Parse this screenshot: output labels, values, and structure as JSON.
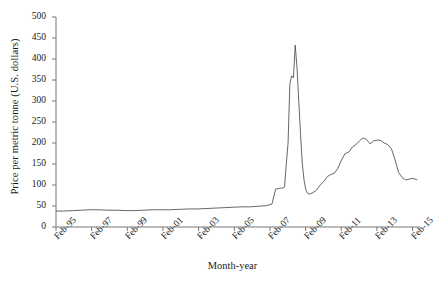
{
  "chart_data": {
    "type": "line",
    "title": "",
    "xlabel": "Month-year",
    "ylabel": "Price per metric tonne (U.S. dollars)",
    "ylim": [
      0,
      500
    ],
    "ytick_labels": [
      "0",
      "50",
      "100",
      "150",
      "200",
      "250",
      "300",
      "350",
      "400",
      "450",
      "500"
    ],
    "ytick_values": [
      0,
      50,
      100,
      150,
      200,
      250,
      300,
      350,
      400,
      450,
      500
    ],
    "xtick_labels": [
      "Feb-95",
      "Feb-97",
      "Feb-99",
      "Feb-01",
      "Feb-03",
      "Feb-05",
      "Feb-07",
      "Feb-09",
      "Feb-11",
      "Feb-13",
      "Feb-15"
    ],
    "xtick_values": [
      1995.083,
      1997.083,
      1999.083,
      2001.083,
      2003.083,
      2005.083,
      2007.083,
      2009.083,
      2011.083,
      2013.083,
      2015.083
    ],
    "xlim": [
      1995.083,
      2015.5
    ],
    "grid": false,
    "legend": null,
    "line_color": "#555555",
    "line_width": 0.9,
    "series": [
      {
        "name": "Price per metric tonne",
        "x": [
          1995.08,
          1995.5,
          1996.0,
          1996.5,
          1997.0,
          1997.5,
          1998.0,
          1998.5,
          1999.0,
          1999.5,
          2000.0,
          2000.5,
          2001.0,
          2001.5,
          2002.0,
          2002.5,
          2003.0,
          2003.5,
          2004.0,
          2004.5,
          2005.0,
          2005.5,
          2006.0,
          2006.3,
          2006.6,
          2006.9,
          2007.0,
          2007.2,
          2007.4,
          2007.6,
          2007.8,
          2007.9,
          2008.0,
          2008.1,
          2008.2,
          2008.3,
          2008.4,
          2008.5,
          2008.6,
          2008.7,
          2008.8,
          2008.9,
          2009.0,
          2009.1,
          2009.2,
          2009.3,
          2009.5,
          2009.7,
          2009.9,
          2010.1,
          2010.3,
          2010.5,
          2010.7,
          2010.9,
          2011.1,
          2011.3,
          2011.5,
          2011.7,
          2011.9,
          2012.1,
          2012.3,
          2012.5,
          2012.7,
          2012.9,
          2013.1,
          2013.3,
          2013.5,
          2013.7,
          2013.9,
          2014.1,
          2014.3,
          2014.5,
          2014.7,
          2014.9,
          2015.1,
          2015.35
        ],
        "y": [
          38,
          38,
          39,
          40,
          41,
          41,
          40,
          40,
          39,
          39,
          40,
          41,
          41,
          41,
          42,
          43,
          43,
          44,
          45,
          46,
          47,
          48,
          48,
          49,
          50,
          51,
          52,
          55,
          90,
          92,
          93,
          95,
          150,
          200,
          340,
          360,
          355,
          433,
          380,
          300,
          220,
          150,
          110,
          88,
          80,
          78,
          82,
          88,
          100,
          108,
          120,
          125,
          128,
          140,
          160,
          175,
          178,
          190,
          196,
          205,
          212,
          208,
          198,
          205,
          207,
          206,
          200,
          196,
          186,
          160,
          130,
          118,
          112,
          114,
          116,
          112
        ]
      }
    ]
  },
  "axes": {
    "y_axis_name": "y-axis",
    "x_axis_name": "x-axis"
  }
}
